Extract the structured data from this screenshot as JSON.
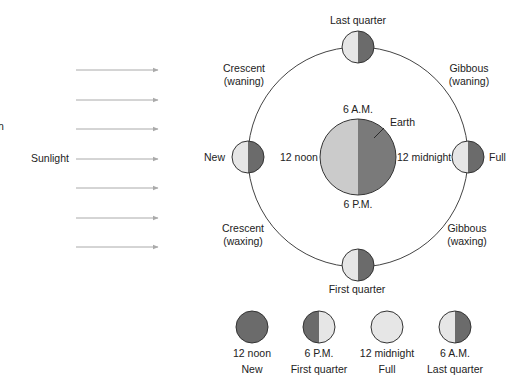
{
  "diagram": {
    "sunlight_label": "Sunlight",
    "edge_fragment": "n",
    "earth": {
      "label": "Earth",
      "times": {
        "top": "6 A.M.",
        "left": "12 noon",
        "right": "12 midnight",
        "bottom": "6 P.M."
      }
    },
    "orbit_phases": {
      "top": "Last quarter",
      "left": "New",
      "right": "Full",
      "bottom": "First quarter",
      "upper_left": {
        "line1": "Crescent",
        "line2": "(waning)"
      },
      "upper_right": {
        "line1": "Gibbous",
        "line2": "(waning)"
      },
      "lower_left": {
        "line1": "Crescent",
        "line2": "(waxing)"
      },
      "lower_right": {
        "line1": "Gibbous",
        "line2": "(waxing)"
      }
    },
    "appearance_row": [
      {
        "time": "12 noon",
        "phase": "New",
        "type": "dark"
      },
      {
        "time": "6 P.M.",
        "phase": "First quarter",
        "type": "right-lit"
      },
      {
        "time": "12 midnight",
        "phase": "Full",
        "type": "lit"
      },
      {
        "time": "6 A.M.",
        "phase": "Last quarter",
        "type": "left-lit"
      }
    ],
    "colors": {
      "lit": "#e6e6e6",
      "dark": "#6b6b6b",
      "earth_lit": "#cbcbcb",
      "earth_dark": "#7a7a7a",
      "arrow": "#aaaaaa",
      "stroke": "#333333"
    }
  }
}
